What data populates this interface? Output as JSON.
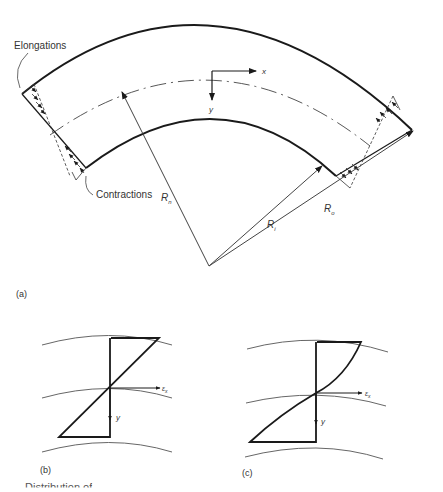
{
  "figure": {
    "panel_a": {
      "label": "(a)",
      "annotations": {
        "elongations": "Elongations",
        "contractions": "Contractions"
      },
      "axes": {
        "x": "x",
        "y": "y"
      },
      "radii": {
        "neutral": {
          "symbol": "R",
          "subscript": "n"
        },
        "inner": {
          "symbol": "R",
          "subscript": "i"
        },
        "outer": {
          "symbol": "R",
          "subscript": "o"
        }
      }
    },
    "panel_b": {
      "label": "(b)",
      "axes": {
        "strain": "ε",
        "strain_sub": "x",
        "y": "y"
      },
      "distribution": "linear"
    },
    "panel_c": {
      "label": "(c)",
      "axes": {
        "strain": "ε",
        "strain_sub": "x",
        "y": "y"
      },
      "distribution": "nonlinear (curved)"
    },
    "caption_visible": "Distribution of"
  },
  "colors": {
    "line": "#1a1a1a",
    "thin_line": "#555555",
    "background": "#ffffff"
  }
}
